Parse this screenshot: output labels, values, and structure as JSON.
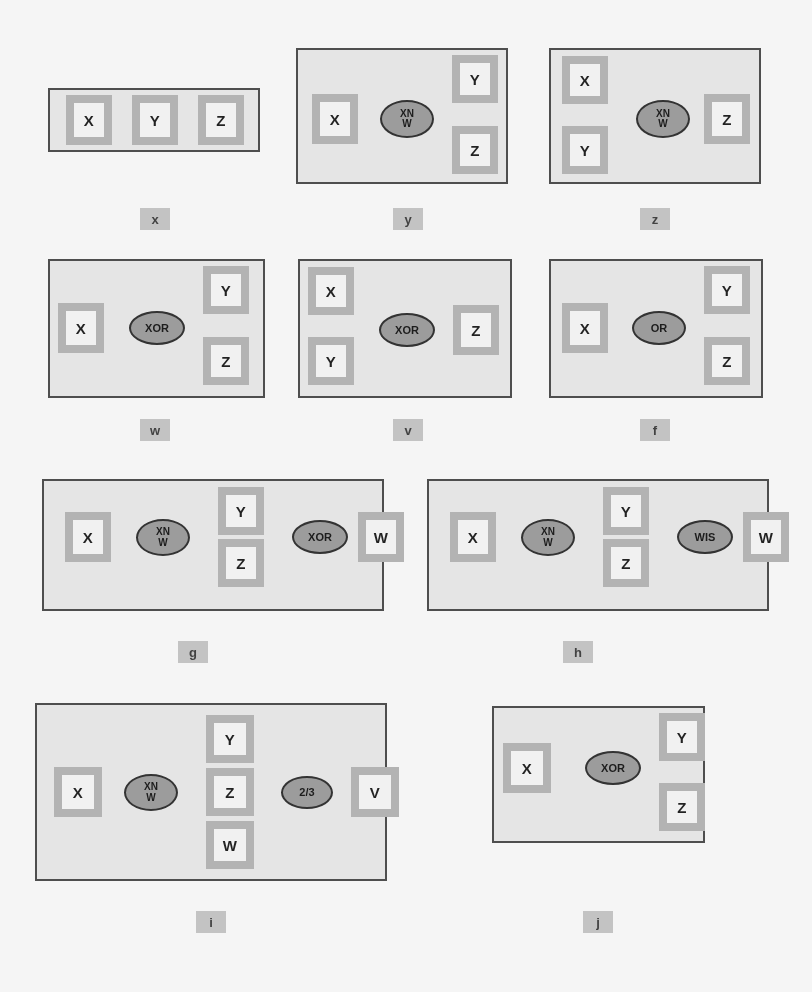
{
  "figure": {
    "title": "",
    "panel_count": 10,
    "node_fill": "#fbfbfb",
    "node_shadow": "#b8b8b8",
    "gate_fill": "#9e9e9e",
    "panel_fill": "#eeeeee",
    "panel_border": "#4a4a4a",
    "caption_fill": "#c9c9c9",
    "edge_color": "#1a1a1a"
  },
  "panels": [
    {
      "id": "a",
      "caption": "x",
      "nodes": [
        {
          "name": "X",
          "label": "X"
        },
        {
          "name": "Y",
          "label": "Y"
        },
        {
          "name": "Z",
          "label": "Z"
        }
      ],
      "gates": [],
      "edges": [
        {
          "from": "X",
          "to": "Y",
          "type": "arrow"
        },
        {
          "from": "Y",
          "to": "Z",
          "type": "arrow"
        }
      ]
    },
    {
      "id": "b",
      "caption": "y",
      "nodes": [
        {
          "name": "X",
          "label": "X"
        },
        {
          "name": "Y",
          "label": "Y"
        },
        {
          "name": "Z",
          "label": "Z"
        }
      ],
      "gates": [
        {
          "name": "XNW",
          "line1": "XN",
          "line2": "W"
        }
      ],
      "edges": [
        {
          "from": "X",
          "to": "XNW",
          "type": "arrow"
        },
        {
          "from": "XNW",
          "to": "Y",
          "type": "arrow"
        },
        {
          "from": "XNW",
          "to": "Z",
          "type": "arrow"
        }
      ]
    },
    {
      "id": "c",
      "caption": "z",
      "nodes": [
        {
          "name": "X",
          "label": "X"
        },
        {
          "name": "Y",
          "label": "Y"
        },
        {
          "name": "Z",
          "label": "Z"
        }
      ],
      "gates": [
        {
          "name": "XNW",
          "line1": "XN",
          "line2": "W"
        }
      ],
      "edges": [
        {
          "from": "X",
          "to": "XNW",
          "type": "arrow"
        },
        {
          "from": "Y",
          "to": "XNW",
          "type": "arrow"
        },
        {
          "from": "XNW",
          "to": "Z",
          "type": "arrow"
        }
      ]
    },
    {
      "id": "d",
      "caption": "w",
      "nodes": [
        {
          "name": "X",
          "label": "X"
        },
        {
          "name": "Y",
          "label": "Y"
        },
        {
          "name": "Z",
          "label": "Z"
        }
      ],
      "gates": [
        {
          "name": "XOR",
          "line1": "XOR",
          "line2": ""
        }
      ],
      "edges": [
        {
          "from": "X",
          "to": "XOR",
          "type": "arrow"
        },
        {
          "from": "XOR",
          "to": "Y",
          "type": "arrow"
        },
        {
          "from": "XOR",
          "to": "Z",
          "type": "arrow"
        }
      ]
    },
    {
      "id": "e",
      "caption": "v",
      "nodes": [
        {
          "name": "X",
          "label": "X"
        },
        {
          "name": "Y",
          "label": "Y"
        },
        {
          "name": "Z",
          "label": "Z"
        }
      ],
      "gates": [
        {
          "name": "XOR",
          "line1": "XOR",
          "line2": ""
        }
      ],
      "edges": [
        {
          "from": "X",
          "to": "XOR",
          "type": "arrow"
        },
        {
          "from": "Y",
          "to": "XOR",
          "type": "arrow"
        },
        {
          "from": "XOR",
          "to": "Z",
          "type": "arrow"
        }
      ]
    },
    {
      "id": "f",
      "caption": "f",
      "nodes": [
        {
          "name": "X",
          "label": "X"
        },
        {
          "name": "Y",
          "label": "Y"
        },
        {
          "name": "Z",
          "label": "Z"
        }
      ],
      "gates": [
        {
          "name": "OR",
          "line1": "OR",
          "line2": ""
        }
      ],
      "edges": [
        {
          "from": "X",
          "to": "OR",
          "type": "arrow"
        },
        {
          "from": "OR",
          "to": "Y",
          "type": "arrow"
        },
        {
          "from": "OR",
          "to": "Z",
          "type": "arrow"
        }
      ]
    },
    {
      "id": "g",
      "caption": "g",
      "nodes": [
        {
          "name": "X",
          "label": "X"
        },
        {
          "name": "Y",
          "label": "Y"
        },
        {
          "name": "Z",
          "label": "Z"
        },
        {
          "name": "W",
          "label": "W"
        }
      ],
      "gates": [
        {
          "name": "XNW",
          "line1": "XN",
          "line2": "W"
        },
        {
          "name": "XOR",
          "line1": "XOR",
          "line2": ""
        }
      ],
      "edges": [
        {
          "from": "X",
          "to": "XNW",
          "type": "arrow"
        },
        {
          "from": "XNW",
          "to": "Y",
          "type": "arrow"
        },
        {
          "from": "XNW",
          "to": "Z",
          "type": "arrow"
        },
        {
          "from": "Y",
          "to": "XOR",
          "type": "arrow"
        },
        {
          "from": "Z",
          "to": "XOR",
          "type": "arrow"
        },
        {
          "from": "XOR",
          "to": "W",
          "type": "arrow"
        }
      ]
    },
    {
      "id": "h",
      "caption": "h",
      "nodes": [
        {
          "name": "X",
          "label": "X"
        },
        {
          "name": "Y",
          "label": "Y"
        },
        {
          "name": "Z",
          "label": "Z"
        },
        {
          "name": "W",
          "label": "W"
        }
      ],
      "gates": [
        {
          "name": "XNW",
          "line1": "XN",
          "line2": "W"
        },
        {
          "name": "WIS",
          "line1": "WIS",
          "line2": ""
        }
      ],
      "edges": [
        {
          "from": "X",
          "to": "XNW",
          "type": "arrow"
        },
        {
          "from": "XNW",
          "to": "Y",
          "type": "arrow"
        },
        {
          "from": "XNW",
          "to": "Z",
          "type": "arrow"
        },
        {
          "from": "Y",
          "to": "WIS",
          "type": "arrow"
        },
        {
          "from": "Z",
          "to": "WIS",
          "type": "arrow"
        },
        {
          "from": "WIS",
          "to": "W",
          "type": "arrow"
        }
      ]
    },
    {
      "id": "i",
      "caption": "i",
      "nodes": [
        {
          "name": "X",
          "label": "X"
        },
        {
          "name": "Y",
          "label": "Y"
        },
        {
          "name": "Z",
          "label": "Z"
        },
        {
          "name": "W",
          "label": "W"
        },
        {
          "name": "V",
          "label": "V"
        }
      ],
      "gates": [
        {
          "name": "XNW",
          "line1": "XN",
          "line2": "W"
        },
        {
          "name": "TWOTHIRDS",
          "line1": "2/3",
          "line2": ""
        }
      ],
      "edges": [
        {
          "from": "X",
          "to": "XNW",
          "type": "arrow"
        },
        {
          "from": "XNW",
          "to": "Y",
          "type": "arrow"
        },
        {
          "from": "XNW",
          "to": "Z",
          "type": "arrow"
        },
        {
          "from": "XNW",
          "to": "W",
          "type": "arrow"
        },
        {
          "from": "Y",
          "to": "TWOTHIRDS",
          "type": "arrow"
        },
        {
          "from": "Z",
          "to": "TWOTHIRDS",
          "type": "arrow"
        },
        {
          "from": "W",
          "to": "TWOTHIRDS",
          "type": "arrow"
        },
        {
          "from": "TWOTHIRDS",
          "to": "V",
          "type": "arrow"
        }
      ]
    },
    {
      "id": "j",
      "caption": "j",
      "nodes": [
        {
          "name": "X",
          "label": "X"
        },
        {
          "name": "Y",
          "label": "Y"
        },
        {
          "name": "Z",
          "label": "Z"
        }
      ],
      "gates": [
        {
          "name": "XOR",
          "line1": "XOR",
          "line2": ""
        }
      ],
      "edges": [
        {
          "from": "X",
          "to": "XOR",
          "type": "arrow"
        },
        {
          "from": "XOR",
          "to": "Y",
          "type": "arrow"
        },
        {
          "from": "XOR",
          "to": "Z",
          "type": "arrow"
        },
        {
          "from": "Y",
          "to": "Z",
          "type": "double-arrow"
        }
      ]
    }
  ]
}
